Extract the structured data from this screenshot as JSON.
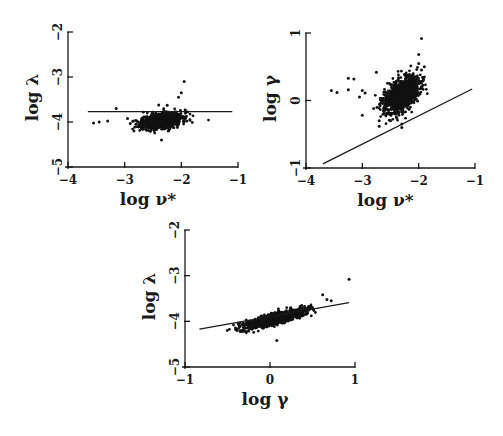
{
  "chart_data": [
    {
      "id": "panel-top-left",
      "type": "scatter",
      "title": "",
      "xlabel": "log ν*",
      "ylabel": "log λ",
      "xlim": [
        -4,
        -1
      ],
      "ylim": [
        -5,
        -2
      ],
      "xticks": [
        -4,
        -3,
        -2,
        -1
      ],
      "yticks": [
        -5,
        -4,
        -3,
        -2
      ],
      "xtick_labels": [
        "−4",
        "−3",
        "−2",
        "−1"
      ],
      "ytick_labels": [
        "−5",
        "−4",
        "−3",
        "−2"
      ],
      "grid": false,
      "legend": null,
      "pixel_box": {
        "x0": 68,
        "x1": 238,
        "y_top": 32,
        "y_bottom": 167
      },
      "fit_line": {
        "x": [
          -3.65,
          -1.1
        ],
        "y": [
          -3.77,
          -3.77
        ],
        "slope": 0
      },
      "cloud": {
        "center": [
          -2.35,
          -3.97
        ],
        "spread": [
          0.18,
          0.09
        ],
        "corr": 0.35,
        "count": 900,
        "seed": 11
      },
      "outliers": [
        [
          -3.55,
          -4.02
        ],
        [
          -3.45,
          -4.0
        ],
        [
          -3.15,
          -3.7
        ],
        [
          -3.3,
          -3.98
        ],
        [
          -2.95,
          -3.92
        ],
        [
          -2.9,
          -4.03
        ],
        [
          -2.85,
          -3.98
        ],
        [
          -2.7,
          -4.15
        ],
        [
          -2.35,
          -4.4
        ],
        [
          -2.1,
          -4.05
        ],
        [
          -1.95,
          -3.1
        ],
        [
          -2.0,
          -3.35
        ],
        [
          -2.05,
          -3.45
        ],
        [
          -2.25,
          -3.63
        ],
        [
          -2.4,
          -3.62
        ],
        [
          -2.5,
          -4.12
        ],
        [
          -2.2,
          -4.12
        ]
      ]
    },
    {
      "id": "panel-top-right",
      "type": "scatter",
      "title": "",
      "xlabel": "log ν*",
      "ylabel": "log γ",
      "xlim": [
        -4,
        -1
      ],
      "ylim": [
        -1,
        1
      ],
      "xticks": [
        -4,
        -3,
        -2,
        -1
      ],
      "yticks": [
        -1,
        0,
        1
      ],
      "xtick_labels": [
        "−4",
        "−3",
        "−2",
        "−1"
      ],
      "ytick_labels": [
        "−1",
        "0",
        "1"
      ],
      "grid": false,
      "legend": null,
      "pixel_box": {
        "x0": 306,
        "x1": 475,
        "y_top": 33,
        "y_bottom": 168
      },
      "fit_line": {
        "x": [
          -3.7,
          -1.05
        ],
        "y": [
          -0.94,
          0.17
        ]
      },
      "cloud": {
        "center": [
          -2.3,
          0.08
        ],
        "spread": [
          0.15,
          0.13
        ],
        "corr": 0.45,
        "count": 1100,
        "seed": 23
      },
      "outliers": [
        [
          -3.55,
          0.15
        ],
        [
          -3.45,
          0.12
        ],
        [
          -3.25,
          0.33
        ],
        [
          -3.15,
          0.32
        ],
        [
          -3.25,
          0.16
        ],
        [
          -3.0,
          0.15
        ],
        [
          -3.0,
          -0.22
        ],
        [
          -2.95,
          0.11
        ],
        [
          -3.05,
          0.05
        ],
        [
          -2.8,
          -0.12
        ],
        [
          -2.75,
          0.42
        ],
        [
          -2.7,
          -0.3
        ],
        [
          -2.7,
          -0.38
        ],
        [
          -2.6,
          -0.2
        ],
        [
          -2.5,
          -0.3
        ],
        [
          -2.3,
          -0.4
        ],
        [
          -2.3,
          -0.35
        ],
        [
          -2.0,
          0.55
        ],
        [
          -2.0,
          0.68
        ],
        [
          -1.95,
          0.92
        ],
        [
          -1.95,
          0.45
        ],
        [
          -1.9,
          0.5
        ],
        [
          -1.9,
          0.35
        ]
      ]
    },
    {
      "id": "panel-bottom",
      "type": "scatter",
      "title": "",
      "xlabel": "log γ",
      "ylabel": "log λ",
      "xlim": [
        -1,
        1
      ],
      "ylim": [
        -5,
        -2
      ],
      "xticks": [
        -1,
        0,
        1
      ],
      "yticks": [
        -5,
        -4,
        -3,
        -2
      ],
      "xtick_labels": [
        "−1",
        "0",
        "1"
      ],
      "ytick_labels": [
        "−5",
        "−4",
        "−3",
        "−2"
      ],
      "grid": false,
      "legend": null,
      "pixel_box": {
        "x0": 185,
        "x1": 355,
        "y_top": 230,
        "y_bottom": 367
      },
      "fit_line": {
        "x": [
          -0.83,
          0.93
        ],
        "y": [
          -4.17,
          -3.59
        ]
      },
      "cloud": {
        "center": [
          0.05,
          -3.95
        ],
        "spread": [
          0.17,
          0.1
        ],
        "corr": 0.8,
        "count": 1000,
        "seed": 37
      },
      "outliers": [
        [
          -0.35,
          -4.22
        ],
        [
          -0.32,
          -4.21
        ],
        [
          -0.28,
          -3.97
        ],
        [
          -0.25,
          -4.21
        ],
        [
          0.08,
          -4.42
        ],
        [
          0.62,
          -3.42
        ],
        [
          0.67,
          -3.52
        ],
        [
          0.72,
          -3.55
        ],
        [
          0.93,
          -3.08
        ],
        [
          0.5,
          -3.7
        ],
        [
          0.45,
          -3.68
        ]
      ]
    }
  ]
}
